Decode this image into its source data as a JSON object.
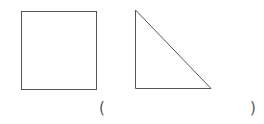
{
  "figure": {
    "stroke_color": "#555555",
    "shapes": [
      {
        "type": "square",
        "label": "square"
      },
      {
        "type": "right-triangle",
        "label": "right triangle"
      }
    ],
    "answer_blank": {
      "open": "(",
      "close": ")",
      "value": ""
    }
  }
}
